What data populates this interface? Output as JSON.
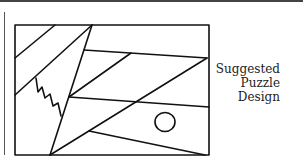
{
  "figure": {
    "title": "Suggested Puzzle Design",
    "caption_lines": [
      "Suggested",
      "Puzzle",
      "Design"
    ],
    "stroke_color": "#111111",
    "shapes": {
      "frame": {
        "x": 15,
        "y": 25,
        "width": 194,
        "height": 130
      },
      "circle": {
        "cx": 165,
        "cy": 122,
        "r": 10
      }
    }
  }
}
